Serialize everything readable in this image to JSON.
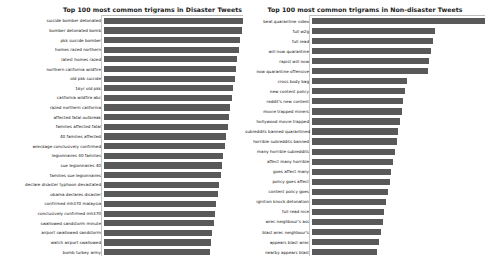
{
  "figure": {
    "background_color": "#ffffff",
    "bar_color": "#595959",
    "text_color": "#111111"
  },
  "chart_data": [
    {
      "type": "bar",
      "orientation": "horizontal",
      "title": "Top 100 most common trigrams in Disaster Tweets",
      "xlabel": "",
      "ylabel": "",
      "grid": false,
      "legend": null,
      "xlim": [
        0,
        100
      ],
      "categories": [
        "suicide bomber detonated",
        "bomber detonated bomb",
        "pkk suicide bomber",
        "homes razed northern",
        "latest homes razed",
        "northern california wildfire",
        "old pkk suicide",
        "16yr old pkk",
        "california wildfire abc",
        "razed northern california",
        "affected fatal outbreak",
        "families affected fatal",
        "40 families affected",
        "wreckage conclusively confirmed",
        "legionnaires 40 families",
        "sue legionnaires 40",
        "families sue legionnaires",
        "declare disaster typhoon devastated",
        "obama declares disaster",
        "confirmed mh370 malaysia",
        "conclusively confirmed mh370",
        "swallowed sandstorm minute",
        "airport swallowed sandstorm",
        "watch airport swallowed",
        "bomb turkey army"
      ],
      "values": [
        100,
        99,
        98,
        97,
        96,
        95,
        94,
        93,
        92,
        91,
        90,
        89,
        88,
        87,
        86,
        85,
        84,
        83,
        82,
        81,
        80,
        79,
        78,
        77,
        76
      ]
    },
    {
      "type": "bar",
      "orientation": "horizontal",
      "title": "Top 100 most common trigrams in Non-disaster Tweets",
      "xlabel": "",
      "ylabel": "",
      "grid": false,
      "legend": null,
      "xlim": [
        0,
        100
      ],
      "categories": [
        "beat quarantine video",
        "full w2g",
        "full read",
        "will now quarantine",
        "rapist will now",
        "now quarantine offensive",
        "cross body bag",
        "new content policy",
        "reddit's new content",
        "movie trapped miners",
        "hollywood movie trapped",
        "subreddits banned quarantined",
        "horrible subreddits banned",
        "many horrible subreddits",
        "affect many horrible",
        "goes affect many",
        "policy goes affect",
        "content policy goes",
        "ignition knock detonation",
        "full read nice",
        "wrec neighbour's ass",
        "blast wrec neighbour's",
        "appears blast wrec",
        "nearby appears blast"
      ],
      "values": [
        100,
        71,
        70,
        69,
        68,
        67,
        55,
        54,
        53,
        52,
        51,
        50,
        49,
        48,
        47,
        46,
        45,
        44,
        43,
        42,
        41,
        40,
        39,
        38
      ]
    }
  ]
}
